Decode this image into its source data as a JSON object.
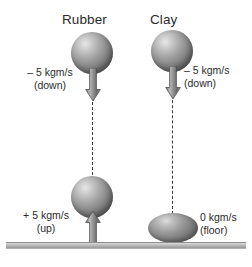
{
  "figure": {
    "type": "physics-diagram",
    "background_color": "#ffffff"
  },
  "columns": [
    {
      "id": "rubber",
      "title": "Rubber",
      "before": {
        "momentum": "– 5 kgm/s",
        "direction": "(down)",
        "arrow": "down-arrow-icon"
      },
      "after": {
        "momentum": "+ 5 kgm/s",
        "direction": "(up)",
        "arrow": "up-arrow-icon"
      }
    },
    {
      "id": "clay",
      "title": "Clay",
      "before": {
        "momentum": "– 5 kgm/s",
        "direction": "(down)",
        "arrow": "down-arrow-icon"
      },
      "after": {
        "momentum": "0 kgm/s",
        "direction": "(floor)",
        "arrow": "none"
      }
    }
  ],
  "colors": {
    "text": "#2b2b2b",
    "sphere_light": "#e8e8e8",
    "sphere_dark": "#5d5d5d",
    "arrow_fill": "#8a8a8a",
    "arrow_stroke": "#4a4a4a",
    "dash_line": "#3a3a3a",
    "floor": "#b4b4b4"
  }
}
